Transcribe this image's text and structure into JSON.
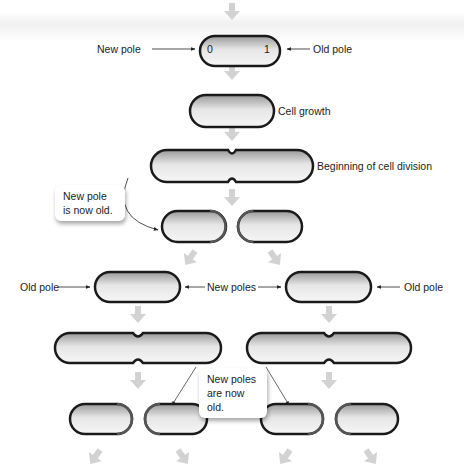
{
  "figure": {
    "colors": {
      "cell_fill_light": "#f2f2f2",
      "cell_fill_dark": "#9a9a9a",
      "old_pole_stroke": "#1a1a1a",
      "new_pole_stroke": "#555555",
      "flow_arrow": "#cfcfcf",
      "label_text": "#222222"
    }
  },
  "stage1": {
    "pole_number_left": "0",
    "pole_number_right": "1",
    "label_left": "New pole",
    "label_right": "Old pole"
  },
  "stage2": {
    "label": "Cell growth"
  },
  "stage3": {
    "label": "Beginning of cell division"
  },
  "callout1": {
    "line1": "New pole",
    "line2": "is now old."
  },
  "stage5": {
    "label_left": "Old pole",
    "label_middle": "New poles",
    "label_right": "Old pole"
  },
  "callout2": {
    "line1": "New poles",
    "line2": "are now old."
  }
}
